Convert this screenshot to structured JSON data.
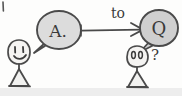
{
  "canvas": {
    "width": 182,
    "height": 96,
    "background_color": "#fdfdfc",
    "ink_color": "#4a4a4a",
    "bubble_fill_left": "#dcdcdc",
    "bubble_fill_right": "#cfcfcf",
    "figure_fill": "#f2f2f0",
    "bottom_band_color": "#ededed",
    "description": "hand-drawn sketch: left stick figure says A. with an arrow labeled to pointing toward a Q bubble above a puzzled right stick figure"
  },
  "diagram_data": {
    "type": "diagram",
    "style": "hand-drawn-sketch",
    "nodes": [
      {
        "id": "answer-bubble",
        "kind": "speech-bubble",
        "label": "A.",
        "x": 59,
        "y": 30,
        "rx": 22,
        "ry": 19,
        "tail_direction": "down-left",
        "fill": "#dcdcdc"
      },
      {
        "id": "question-bubble",
        "kind": "speech-bubble",
        "label": "Q",
        "x": 159,
        "y": 28,
        "rx": 18,
        "ry": 17,
        "tail_direction": "down-left",
        "fill": "#cfcfcf"
      },
      {
        "id": "speaker-figure",
        "kind": "stick-figure",
        "label": "",
        "expression": "smiling",
        "x": 19,
        "y": 52,
        "head_rx": 11,
        "head_ry": 12
      },
      {
        "id": "listener-figure",
        "kind": "stick-figure",
        "label": "",
        "expression": "blank",
        "x": 137,
        "y": 57,
        "head_rx": 10,
        "head_ry": 10
      }
    ],
    "edges": [
      {
        "id": "to-arrow",
        "from": "answer-bubble",
        "to": "question-bubble",
        "label": "to",
        "label_x": 117,
        "label_y": 14,
        "x1": 82,
        "y1": 31,
        "x2": 141,
        "y2": 30,
        "arrowhead": "end"
      }
    ],
    "annotations": [
      {
        "id": "question-mark",
        "text": "?",
        "x": 155,
        "y": 56
      }
    ]
  },
  "labels": {
    "answer": "A.",
    "question": "Q",
    "relation": "to",
    "puzzled": "?"
  }
}
